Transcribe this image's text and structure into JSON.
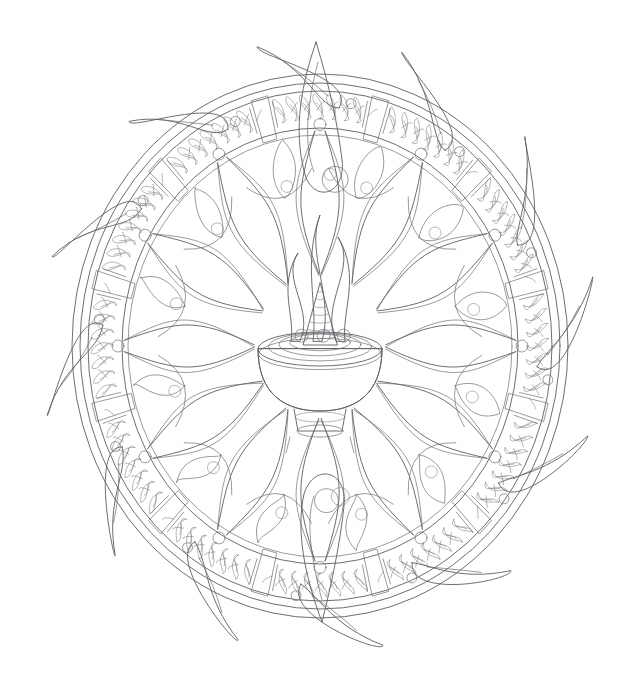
{
  "artwork": {
    "title": "Flame Mandala Coloring Page",
    "subject": "radial mandala of a flaming offering bowl encircled by ornamental flame rings",
    "style": "black-and-white line art / coloring book page",
    "background_color": "#ffffff",
    "line_color": "#5d5d63",
    "canvas": {
      "width": 641,
      "height": 676
    }
  },
  "composition": {
    "center": {
      "x": 320,
      "y": 346
    },
    "outer_ellipse": {
      "rx": 248,
      "ry": 272
    },
    "inner_ellipse": {
      "rx": 232,
      "ry": 255
    },
    "band_outer_rx": 232,
    "band_inner_rx": 198,
    "spoke_count": 12,
    "petal_count": 12,
    "extents": {
      "top_y": 42,
      "bottom_y": 622,
      "left_x": 40,
      "right_x": 601
    }
  },
  "elements": {
    "center_bowl": {
      "name": "offering bowl",
      "rim_rx": 62,
      "rim_ry": 17,
      "rim_y": 349,
      "depth": 46,
      "foot_label": "stepped pedestal foot",
      "ring_count": 4
    },
    "center_flame": {
      "name": "central flame cone",
      "stripe_count": 7,
      "wisp_count": 3
    },
    "crown_flame": {
      "name": "top crown flame",
      "tip_y": 42
    },
    "bottom_flame": {
      "name": "bottom pendant flame",
      "tip_y": 622
    },
    "ring_motifs": {
      "name": "repeating flame-leaf ornament band",
      "segments": 12,
      "motifs_per_segment": 7
    },
    "rivets": {
      "name": "small circles between ring segments",
      "count": 12,
      "radius": 6
    }
  },
  "palette": {
    "paper": "#ffffff",
    "ink": "#5d5d63",
    "ink_light": "#79797f"
  },
  "labels": {
    "page_role": "coloring-page-canvas",
    "figure_caption": ""
  }
}
